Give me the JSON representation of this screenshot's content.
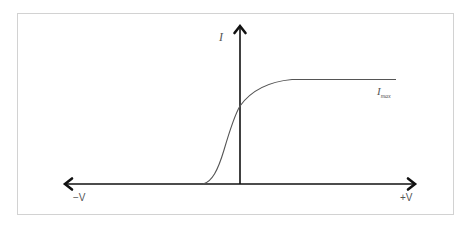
{
  "diagram": {
    "type": "current-voltage characteristic (sigmoid saturation curve)",
    "axes": {
      "y_label": "I",
      "x_negative_label": "−V",
      "x_positive_label": "+V"
    },
    "curve": {
      "saturation_label_main": "I",
      "saturation_label_sub": "max",
      "description": "Current rises from zero at a small negative voltage, passes through the I axis at roughly half of I_max, and saturates at I_max for positive voltage"
    },
    "colors": {
      "axis": "#111111",
      "curve": "#555555",
      "frame": "#d2d2d2",
      "text": "#555555"
    }
  }
}
